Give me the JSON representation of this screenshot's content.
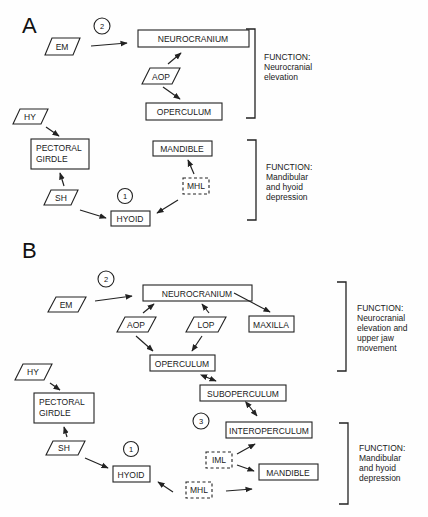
{
  "panels": {
    "A": {
      "label": "A",
      "muscles": {
        "em": "EM",
        "aop": "AOP",
        "hy": "HY",
        "sh": "SH",
        "mhl": "MHL"
      },
      "bones": {
        "neurocranium": "NEUROCRANIUM",
        "operculum": "OPERCULUM",
        "pectoral_line1": "PECTORAL",
        "pectoral_line2": "GIRDLE",
        "mandible": "MANDIBLE",
        "hyoid": "HYOID"
      },
      "couplings": {
        "c1": "1",
        "c2": "2"
      },
      "functions": [
        {
          "lines": [
            "FUNCTION:",
            "Neurocranial",
            "elevation"
          ]
        },
        {
          "lines": [
            "FUNCTION:",
            "Mandibular",
            "and  hyoid",
            "depression"
          ]
        }
      ]
    },
    "B": {
      "label": "B",
      "muscles": {
        "em": "EM",
        "aop": "AOP",
        "lop": "LOP",
        "hy": "HY",
        "sh": "SH",
        "iml": "IML",
        "mhl": "MHL"
      },
      "bones": {
        "neurocranium": "NEUROCRANIUM",
        "maxilla": "MAXILLA",
        "operculum": "OPERCULUM",
        "suboperculum": "SUBOPERCULUM",
        "interoperculum": "INTEROPERCULUM",
        "pectoral_line1": "PECTORAL",
        "pectoral_line2": "GIRDLE",
        "mandible": "MANDIBLE",
        "hyoid": "HYOID"
      },
      "couplings": {
        "c1": "1",
        "c2": "2",
        "c3": "3"
      },
      "functions": [
        {
          "lines": [
            "FUNCTION:",
            "Neurocranial",
            "elevation  and",
            "upper  jaw",
            "movement"
          ]
        },
        {
          "lines": [
            "FUNCTION:",
            "Mandibular",
            "and  hyoid",
            "depression"
          ]
        }
      ]
    }
  }
}
